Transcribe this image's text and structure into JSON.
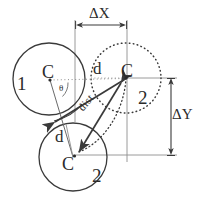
{
  "figure": {
    "stroke_color": "#3a3a3a",
    "text_color": "#2b2b2b",
    "background": "#ffffff"
  },
  "labels": {
    "circle1_index": "1",
    "circle1_center": "C",
    "theta": "θ",
    "circle2_dotted_center": "C",
    "circle2_dotted_index": "2",
    "circle2_dotted_radius": "d",
    "circle2_solid_center": "C",
    "circle2_solid_index": "2",
    "circle2_solid_radius": "d",
    "distance": "dist",
    "delta_x": "ΔX",
    "delta_y": "ΔY"
  },
  "geometry": {
    "circle1": {
      "cx": 49,
      "cy": 79,
      "r": 36,
      "style": "solid"
    },
    "circle2_dotted": {
      "cx": 126,
      "cy": 78,
      "r": 35,
      "style": "dotted"
    },
    "circle2_solid": {
      "cx": 73,
      "cy": 157,
      "r": 34,
      "style": "solid"
    },
    "delta_x_line": {
      "x1": 75,
      "x2": 127,
      "y": 25
    },
    "delta_y_line": {
      "x": 171,
      "y1": 78,
      "y2": 155
    }
  }
}
